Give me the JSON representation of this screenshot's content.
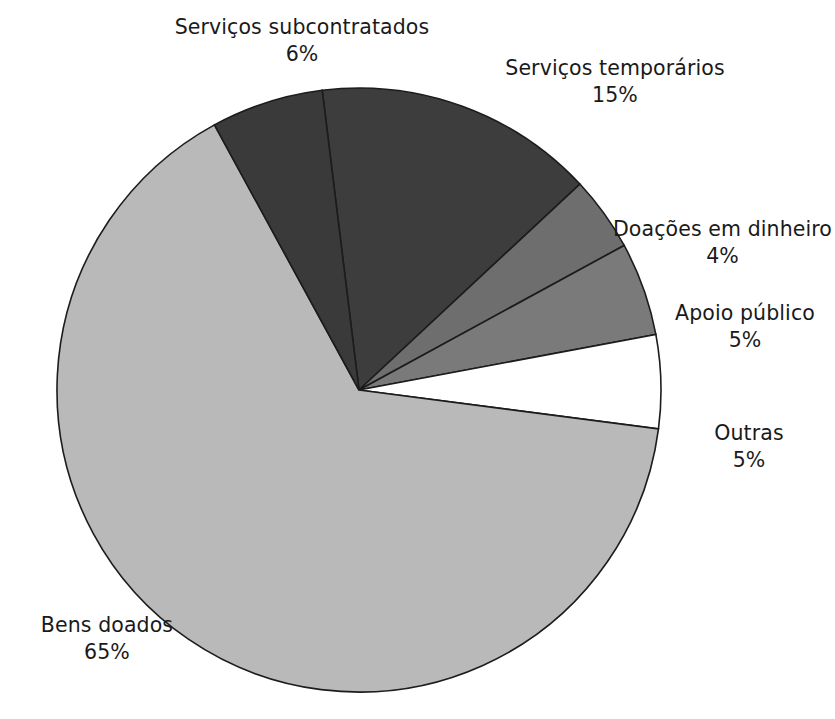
{
  "chart_data": {
    "type": "pie",
    "title": "",
    "subtitle": "",
    "xlabel": "",
    "ylabel": "",
    "legend_position": "none",
    "grid": false,
    "labels_show_percent": true,
    "total": 100,
    "units": "%",
    "categories": [
      "Serviços temporários",
      "Doações em dinheiro",
      "Apoio público",
      "Outras",
      "Bens doados",
      "Serviços subcontratados"
    ],
    "values": [
      15,
      4,
      5,
      5,
      65,
      6
    ],
    "slices": [
      {
        "label": "Serviços temporários",
        "value": 15,
        "value_text": "15%",
        "color": "#3d3d3d",
        "start_angle_deg": -7,
        "end_angle_deg": 47
      },
      {
        "label": "Doações em dinheiro",
        "value": 4,
        "value_text": "4%",
        "color": "#6e6e6e",
        "start_angle_deg": 47,
        "end_angle_deg": 61.4
      },
      {
        "label": "Apoio público",
        "value": 5,
        "value_text": "5%",
        "color": "#7a7a7a",
        "start_angle_deg": 61.4,
        "end_angle_deg": 79.4
      },
      {
        "label": "Outras",
        "value": 5,
        "value_text": "5%",
        "color": "#ffffff",
        "start_angle_deg": 79.4,
        "end_angle_deg": 97.4
      },
      {
        "label": "Bens doados",
        "value": 65,
        "value_text": "65%",
        "color": "#b9b9b9",
        "start_angle_deg": 97.4,
        "end_angle_deg": 331.4
      },
      {
        "label": "Serviços subcontratados",
        "value": 6,
        "value_text": "6%",
        "color": "#3a3a3a",
        "start_angle_deg": 331.4,
        "end_angle_deg": 353
      }
    ],
    "geometry": {
      "center_x": 359,
      "center_y": 390,
      "radius": 302,
      "stroke_color": "#1c1c1c",
      "background": "#ffffff"
    }
  },
  "labels": {
    "subcontratados": {
      "name": "Serviços subcontratados",
      "value": "6%"
    },
    "temporarios": {
      "name": "Serviços temporários",
      "value": "15%"
    },
    "doacoes": {
      "name": "Doações em dinheiro",
      "value": "4%"
    },
    "apoio": {
      "name": "Apoio público",
      "value": "5%"
    },
    "outras": {
      "name": "Outras",
      "value": "5%"
    },
    "bens": {
      "name": "Bens doados",
      "value": "65%"
    }
  }
}
